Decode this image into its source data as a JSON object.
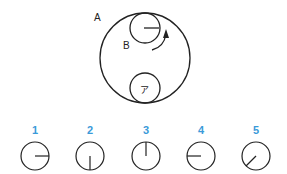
{
  "diagram": {
    "big_circle_label": "A",
    "small_circle_label": "B",
    "inner_small_circle_label": "ア",
    "arrow": "clockwise-rotation-arrow",
    "colors": {
      "line": "#222222",
      "number": "#3a9ad9"
    }
  },
  "options": [
    {
      "number": "1",
      "needle": "right"
    },
    {
      "number": "2",
      "needle": "down"
    },
    {
      "number": "3",
      "needle": "up"
    },
    {
      "number": "4",
      "needle": "left"
    },
    {
      "number": "5",
      "needle": "down-left"
    }
  ]
}
